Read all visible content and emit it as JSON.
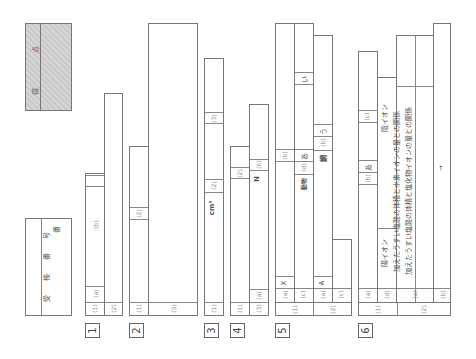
{
  "score_box": {
    "label_ten": "点",
    "label_tokuten": "得"
  },
  "exam_number_box": {
    "label": "受 検 番 号",
    "suffix": "番"
  },
  "questions": [
    {
      "number": "1",
      "parts": [
        {
          "id": "(1)",
          "subs": [
            "(a)",
            "(b)"
          ]
        },
        {
          "id": "(2)",
          "answer": "A → → → →"
        }
      ]
    },
    {
      "number": "2",
      "parts": [
        {
          "id": "(1)",
          "subs": [
            "(2)"
          ]
        },
        {
          "id": "(3)"
        }
      ]
    },
    {
      "number": "3",
      "parts": [
        {
          "id": "(1)",
          "subs": [
            "(2)",
            "(3)"
          ],
          "unit": "cm³"
        }
      ]
    },
    {
      "number": "4",
      "parts": [
        {
          "id": "(1)",
          "subs": [
            "(2)"
          ]
        },
        {
          "id": "(3)",
          "subs": [
            "(a)",
            "(b)"
          ],
          "unit": "N"
        }
      ]
    },
    {
      "number": "5",
      "parts": [
        {
          "id": "(1)",
          "subs": [
            "(a)",
            "(b)"
          ],
          "answer_a": "X"
        },
        {
          "id": "(1)",
          "subs": [
            "(c)",
            "(d)"
          ],
          "answer_c": "動物",
          "answer_d": "あ",
          "answer_d2": "い"
        },
        {
          "id": "(2)",
          "subs": [
            "(a)",
            "(b)"
          ],
          "answer_a": "A",
          "answer_b": "鋼",
          "answer_b2": "う"
        },
        {
          "id": "(2)",
          "subs": [
            "(c)"
          ]
        }
      ]
    },
    {
      "number": "6",
      "parts": [
        {
          "id": "(1)",
          "subs": [
            "(a)",
            "(b)"
          ],
          "answer_b": "あ"
        },
        {
          "id": "(1)",
          "subs": [
            "(d)",
            "(c)"
          ],
          "answer_d": "陽イオン",
          "answer_c2": "陰イオン"
        },
        {
          "id": "(2)",
          "subs": [
            "(a)"
          ],
          "answer_a1": "加えたうすい塩酸の体積と水素イオンの量との関係",
          "answer_a2": "加えたうすい塩酸の体積と塩化物イオンの量との関係"
        },
        {
          "id": "(2)",
          "subs": [
            "(b)"
          ],
          "answer_b": "→"
        }
      ]
    }
  ]
}
